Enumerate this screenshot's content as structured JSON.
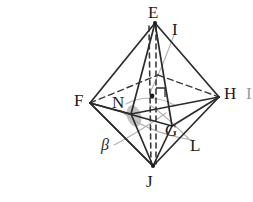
{
  "figure": {
    "background_color": "#ffffff",
    "ink_color": "#2b2b2b",
    "light_ink_color": "#a8a8a8",
    "shade_color": "#9b9b9b",
    "width": 253,
    "height": 202
  },
  "labels": {
    "E": "E",
    "I": "I",
    "F": "F",
    "H": "H",
    "N": "N",
    "G": "G",
    "L": "L",
    "J": "J",
    "beta": "β",
    "clipped_right": "I"
  },
  "label_positions": {
    "E": {
      "x": 148,
      "y": 4
    },
    "I": {
      "x": 172,
      "y": 21
    },
    "F": {
      "x": 74,
      "y": 92
    },
    "H": {
      "x": 224,
      "y": 85
    },
    "N": {
      "x": 112,
      "y": 94
    },
    "G": {
      "x": 165,
      "y": 122
    },
    "L": {
      "x": 190,
      "y": 137
    },
    "J": {
      "x": 146,
      "y": 173
    },
    "beta": {
      "x": 101,
      "y": 137
    },
    "clipped_right": {
      "x": 246,
      "y": 85
    }
  },
  "geometry": {
    "vertices": {
      "E": {
        "x": 155,
        "y": 23
      },
      "J": {
        "x": 153,
        "y": 166
      },
      "F": {
        "x": 90,
        "y": 103
      },
      "H": {
        "x": 219,
        "y": 97
      },
      "G": {
        "x": 172,
        "y": 126
      },
      "I": {
        "x": 158,
        "y": 75
      },
      "N": {
        "x": 131,
        "y": 114
      },
      "center": {
        "x": 152,
        "y": 96
      }
    },
    "solid_edges": [
      [
        "E",
        "F"
      ],
      [
        "E",
        "H"
      ],
      [
        "E",
        "G"
      ],
      [
        "E",
        "J"
      ],
      [
        "J",
        "F"
      ],
      [
        "J",
        "H"
      ],
      [
        "J",
        "G"
      ],
      [
        "J",
        "N"
      ],
      [
        "F",
        "G"
      ],
      [
        "G",
        "H"
      ],
      [
        "F",
        "N"
      ],
      [
        "N",
        "H"
      ]
    ],
    "dashed_edges": [
      [
        "F",
        "I"
      ],
      [
        "I",
        "H"
      ],
      [
        "E",
        "center"
      ],
      [
        "center",
        "J"
      ]
    ],
    "markers": {
      "center_dot": {
        "x": 152,
        "y": 96,
        "r": 2.2
      },
      "right_angle": {
        "x": 154,
        "y": 88,
        "size": 9
      },
      "shaded_angle": {
        "cx": 134,
        "cy": 116,
        "rx": 7,
        "ry": 11,
        "rotation": -18
      }
    },
    "leader_lines": [
      {
        "name": "leader-I",
        "from": {
          "x": 173,
          "y": 33
        },
        "to": {
          "x": 150,
          "y": 92
        }
      },
      {
        "name": "leader-L",
        "from": {
          "x": 190,
          "y": 142
        },
        "to": {
          "x": 150,
          "y": 104
        }
      },
      {
        "name": "leader-beta",
        "from": {
          "x": 113,
          "y": 144
        },
        "to": {
          "x": 164,
          "y": 112
        }
      }
    ]
  }
}
